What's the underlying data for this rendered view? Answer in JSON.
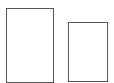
{
  "shapes": [
    {
      "id": "tall-rect",
      "x": 6,
      "y": 8,
      "w": 48,
      "h": 75,
      "stroke": "#555555",
      "fill": "#ffffff"
    },
    {
      "id": "short-rect",
      "x": 68,
      "y": 22,
      "w": 40,
      "h": 60,
      "stroke": "#555555",
      "fill": "#ffffff"
    }
  ]
}
